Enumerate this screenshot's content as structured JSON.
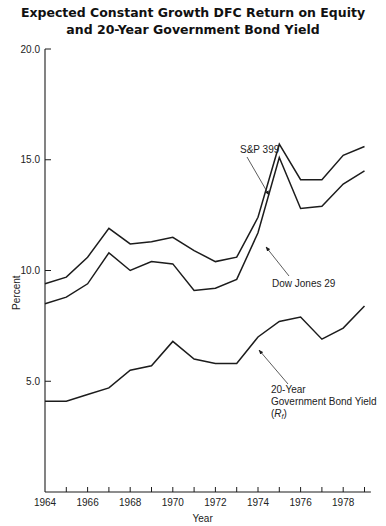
{
  "chart_data": {
    "type": "line",
    "title_line1": "Expected Constant Growth DFC Return on Equity",
    "title_line2": "and 20-Year Government Bond Yield",
    "xlabel": "Year",
    "ylabel": "Percent",
    "ylim": [
      0,
      20
    ],
    "xlim": [
      1964,
      1979
    ],
    "y_ticks": [
      "5.0",
      "10.0",
      "15.0",
      "20.0"
    ],
    "x_tick_labels": [
      "1964",
      "1966",
      "1968",
      "1970",
      "1972",
      "1974",
      "1976",
      "1978"
    ],
    "grid": false,
    "legend": "inline annotations with arrows",
    "x": [
      1964,
      1965,
      1966,
      1967,
      1968,
      1969,
      1970,
      1971,
      1972,
      1973,
      1974,
      1975,
      1976,
      1977,
      1978,
      1979
    ],
    "series": [
      {
        "name": "S&P 399",
        "values": [
          9.4,
          9.7,
          10.6,
          11.9,
          11.2,
          11.3,
          11.5,
          10.9,
          10.4,
          10.6,
          12.4,
          15.7,
          14.1,
          14.1,
          15.2,
          15.6
        ]
      },
      {
        "name": "Dow Jones 29",
        "values": [
          8.5,
          8.8,
          9.4,
          10.8,
          10.0,
          10.4,
          10.3,
          9.1,
          9.2,
          9.6,
          11.7,
          15.1,
          12.8,
          12.9,
          13.9,
          14.5
        ]
      },
      {
        "name": "20-Year Government Bond Yield (Rf)",
        "values": [
          4.1,
          4.1,
          4.4,
          4.7,
          5.5,
          5.7,
          6.8,
          6.0,
          5.8,
          5.8,
          7.0,
          7.7,
          7.9,
          6.9,
          7.4,
          8.4
        ]
      }
    ],
    "annotations": {
      "sp": "S&P 399",
      "dow": "Dow Jones 29",
      "bond_line1": "20-Year",
      "bond_line2": "Government Bond Yield",
      "bond_line3_sym": "R",
      "bond_line3_sub": "f"
    }
  }
}
